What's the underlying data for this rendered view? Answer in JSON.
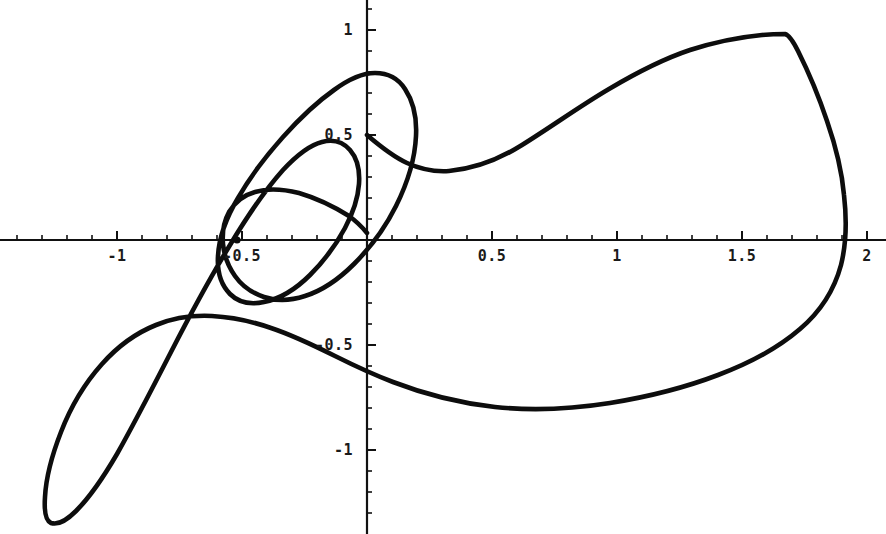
{
  "figure": {
    "title": "",
    "background_color": "#ffffff",
    "curve_color": "#0d0d0d",
    "axis_color": "#111111",
    "width": 886,
    "height": 534
  },
  "axes": {
    "origin_px": {
      "x": 367,
      "y": 240
    },
    "x_scale_px_per_unit": 250,
    "y_scale_px_per_unit": 210,
    "x_axis_label": "",
    "y_axis_label": "",
    "grid": "off",
    "legend": "none",
    "xlim": [
      -1.47,
      2.07
    ],
    "ylim": [
      -1.4,
      1.14
    ],
    "x_major_ticks": [
      {
        "value": -1,
        "label": "-1"
      },
      {
        "value": -0.5,
        "label": "-0.5"
      },
      {
        "value": 0.5,
        "label": "0.5"
      },
      {
        "value": 1,
        "label": "1"
      },
      {
        "value": 1.5,
        "label": "1.5"
      },
      {
        "value": 2,
        "label": "2"
      }
    ],
    "x_minor_tick_step": 0.1,
    "y_major_ticks": [
      {
        "value": 1,
        "label": "1"
      },
      {
        "value": 0.5,
        "label": "0.5"
      },
      {
        "value": -0.5,
        "label": "-0.5"
      },
      {
        "value": -1,
        "label": "-1"
      }
    ],
    "y_minor_tick_step": 0.1
  },
  "chart_data": {
    "type": "line",
    "title": "",
    "xlabel": "",
    "ylabel": "",
    "xlim": [
      -1.47,
      2.07
    ],
    "ylim": [
      -1.4,
      1.14
    ],
    "grid": false,
    "legend_position": "none",
    "series": [
      {
        "name": "closed parametric curve",
        "closed": true,
        "notes": "Single closed self-intersecting curve with one small interior loop near (-0.62,-0.16), a large upper-left lobe peaking near (-0.76,0.97), a large lower-left lobe reaching (-1.33,-1.33), a broad right lobe with a cusp near (1.67,0.98) and rightmost extent near (1.92,0.33).",
        "x": [
          0.0,
          0.08,
          0.17,
          0.28,
          0.42,
          0.58,
          0.76,
          0.95,
          1.13,
          1.27,
          1.4,
          1.52,
          1.62,
          1.67,
          1.74,
          1.83,
          1.89,
          1.92,
          1.91,
          1.86,
          1.77,
          1.64,
          1.48,
          1.3,
          1.1,
          0.9,
          0.7,
          0.5,
          0.32,
          0.16,
          0.02,
          -0.12,
          -0.27,
          -0.44,
          -0.62,
          -0.8,
          -0.98,
          -1.14,
          -1.27,
          -1.33,
          -1.33,
          -1.28,
          -1.18,
          -1.04,
          -0.9,
          -0.76,
          -0.66,
          -0.58,
          -0.55,
          -0.56,
          -0.62,
          -0.7,
          -0.8,
          -0.91,
          -1.02,
          -1.12,
          -1.2,
          -1.25,
          -1.27,
          -1.25,
          -1.19,
          -1.1,
          -0.99,
          -0.88,
          -0.8,
          -0.76,
          -0.77,
          -0.82,
          -0.9,
          -1.0,
          -1.06,
          -1.08,
          -1.05,
          -0.98,
          -0.88,
          -0.76,
          -0.68,
          -0.62,
          -0.58,
          -0.55,
          -0.51,
          -0.45,
          -0.36,
          -0.26,
          -0.14,
          -0.06,
          0.0
        ],
        "y": [
          0.5,
          0.45,
          0.42,
          0.41,
          0.42,
          0.46,
          0.53,
          0.62,
          0.72,
          0.8,
          0.87,
          0.93,
          0.97,
          0.98,
          0.93,
          0.8,
          0.62,
          0.4,
          0.2,
          0.04,
          -0.12,
          -0.26,
          -0.37,
          -0.45,
          -0.49,
          -0.5,
          -0.48,
          -0.44,
          -0.38,
          -0.33,
          -0.3,
          -0.3,
          -0.33,
          -0.4,
          -0.5,
          -0.62,
          -0.76,
          -0.92,
          -1.1,
          -1.25,
          -1.33,
          -1.36,
          -1.34,
          -1.28,
          -1.18,
          -1.05,
          -0.92,
          -0.76,
          -0.6,
          -0.45,
          -0.33,
          -0.25,
          -0.2,
          -0.18,
          -0.16,
          -0.12,
          -0.06,
          0.03,
          0.14,
          0.26,
          0.4,
          0.55,
          0.7,
          0.84,
          0.92,
          0.97,
          0.97,
          0.94,
          0.86,
          0.7,
          0.52,
          0.34,
          0.18,
          0.05,
          -0.04,
          -0.1,
          -0.14,
          -0.16,
          -0.16,
          -0.14,
          -0.1,
          -0.03,
          0.07,
          0.19,
          0.33,
          0.43,
          0.5
        ],
        "key_points": [
          {
            "label": "y-axis crossing (upper)",
            "x": 0.0,
            "y": 0.5
          },
          {
            "label": "local min right-upper arc",
            "x": 0.22,
            "y": 0.41
          },
          {
            "label": "cusp / corner top-right",
            "x": 1.67,
            "y": 0.98
          },
          {
            "label": "rightmost extent",
            "x": 1.92,
            "y": 0.33
          },
          {
            "label": "x-axis crossing (right)",
            "x": 1.85,
            "y": 0.0
          },
          {
            "label": "local min lower arc",
            "x": 0.92,
            "y": -0.5
          },
          {
            "label": "y-axis crossing (lower)",
            "x": 0.0,
            "y": -0.3
          },
          {
            "label": "bottom of lower-left lobe",
            "x": -1.25,
            "y": -1.34
          },
          {
            "label": "leftmost extent",
            "x": -1.34,
            "y": -1.22
          },
          {
            "label": "top of upper-left lobe",
            "x": -0.78,
            "y": 0.97
          },
          {
            "label": "small interior loop bottom",
            "x": -0.58,
            "y": -0.16
          },
          {
            "label": "self-intersection node",
            "x": -0.68,
            "y": 0.01
          },
          {
            "label": "marked dot on x-axis",
            "x": -0.52,
            "y": 0.0
          }
        ]
      }
    ]
  },
  "annotations": {
    "dot_marker": {
      "x": -0.52,
      "y": 0.0,
      "radius_px": 3.4
    }
  }
}
